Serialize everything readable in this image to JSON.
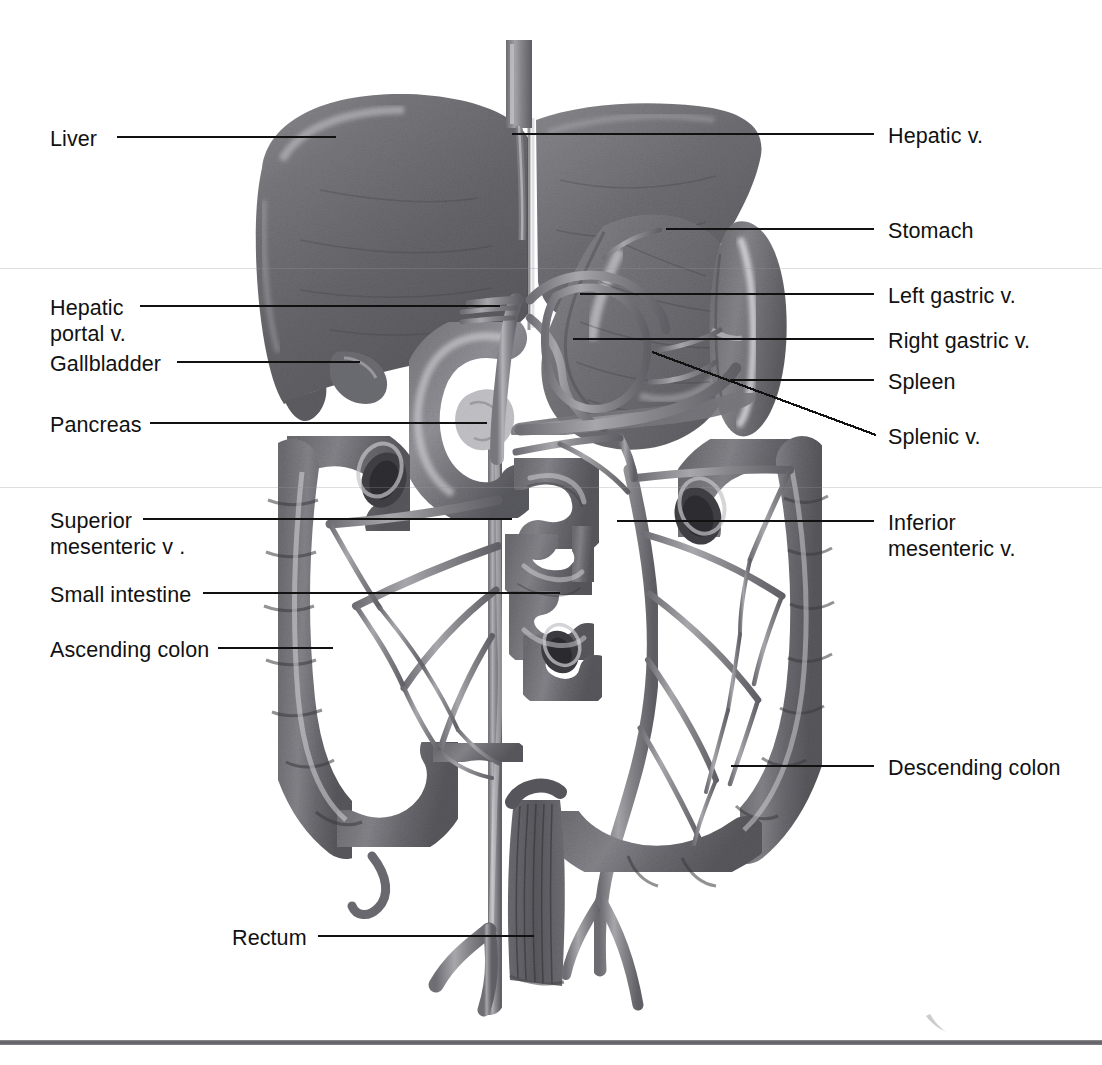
{
  "figure": {
    "style": "grayscale anatomical illustration",
    "background_color": "#ffffff",
    "line_color": "#111111",
    "rule_color": "#5d5d63"
  },
  "labels_left": [
    {
      "id": "liver",
      "text": "Liver",
      "x": 50,
      "y": 126,
      "lines": [
        "Liver"
      ],
      "leader": {
        "x1": 117,
        "y1": 137,
        "x2": 336,
        "y2": 137
      }
    },
    {
      "id": "hepatic-portal-v",
      "text": "Hepatic portal v.",
      "x": 50,
      "y": 295,
      "lines": [
        "Hepatic",
        "portal v."
      ],
      "leader": {
        "x1": 140,
        "y1": 306,
        "x2": 500,
        "y2": 306
      }
    },
    {
      "id": "gallbladder",
      "text": "Gallbladder",
      "x": 50,
      "y": 351,
      "lines": [
        "Gallbladder"
      ],
      "leader": {
        "x1": 177,
        "y1": 362,
        "x2": 360,
        "y2": 362
      }
    },
    {
      "id": "pancreas",
      "text": "Pancreas",
      "x": 50,
      "y": 412,
      "lines": [
        "Pancreas"
      ],
      "leader": {
        "x1": 150,
        "y1": 423,
        "x2": 487,
        "y2": 423
      }
    },
    {
      "id": "superior-mesenteric-v",
      "text": "Superior mesenteric v .",
      "x": 50,
      "y": 508,
      "lines": [
        "Superior",
        "mesenteric v ."
      ],
      "leader": {
        "x1": 143,
        "y1": 519,
        "x2": 512,
        "y2": 519
      }
    },
    {
      "id": "small-intestine",
      "text": "Small intestine",
      "x": 50,
      "y": 582,
      "lines": [
        "Small intestine"
      ],
      "leader": {
        "x1": 203,
        "y1": 593,
        "x2": 560,
        "y2": 593
      }
    },
    {
      "id": "ascending-colon",
      "text": "Ascending colon",
      "x": 50,
      "y": 637,
      "lines": [
        "Ascending colon"
      ],
      "leader": {
        "x1": 218,
        "y1": 648,
        "x2": 333,
        "y2": 648
      }
    },
    {
      "id": "rectum",
      "text": "Rectum",
      "x": 232,
      "y": 925,
      "lines": [
        "Rectum"
      ],
      "leader": {
        "x1": 318,
        "y1": 936,
        "x2": 534,
        "y2": 936
      }
    }
  ],
  "labels_right": [
    {
      "id": "hepatic-v",
      "text": "Hepatic v.",
      "x": 888,
      "y": 123,
      "lines": [
        "Hepatic v."
      ],
      "leader": {
        "x1": 512,
        "y1": 134,
        "x2": 874,
        "y2": 134
      }
    },
    {
      "id": "stomach",
      "text": "Stomach",
      "x": 888,
      "y": 218,
      "lines": [
        "Stomach"
      ],
      "leader": {
        "x1": 666,
        "y1": 229,
        "x2": 874,
        "y2": 229
      }
    },
    {
      "id": "left-gastric-v",
      "text": "Left gastric v.",
      "x": 888,
      "y": 283,
      "lines": [
        "Left gastric v."
      ],
      "leader": {
        "x1": 580,
        "y1": 294,
        "x2": 874,
        "y2": 294
      }
    },
    {
      "id": "right-gastric-v",
      "text": "Right gastric v.",
      "x": 888,
      "y": 328,
      "lines": [
        "Right gastric v."
      ],
      "leader": {
        "x1": 573,
        "y1": 339,
        "x2": 874,
        "y2": 339
      }
    },
    {
      "id": "spleen",
      "text": "Spleen",
      "x": 888,
      "y": 369,
      "lines": [
        "Spleen"
      ],
      "leader": {
        "x1": 730,
        "y1": 380,
        "x2": 874,
        "y2": 380
      }
    },
    {
      "id": "splenic-v",
      "text": "Splenic v.",
      "x": 888,
      "y": 424,
      "lines": [
        "Splenic v."
      ],
      "leader": {
        "x1": 652,
        "y1": 352,
        "x2": 876,
        "y2": 435
      }
    },
    {
      "id": "inferior-mesenteric-v",
      "text": "Inferior mesenteric v.",
      "x": 888,
      "y": 510,
      "lines": [
        "Inferior",
        "mesenteric v."
      ],
      "leader": {
        "x1": 617,
        "y1": 521,
        "x2": 874,
        "y2": 521
      }
    },
    {
      "id": "descending-colon",
      "text": "Descending colon",
      "x": 888,
      "y": 755,
      "lines": [
        "Descending colon"
      ],
      "leader": {
        "x1": 731,
        "y1": 766,
        "x2": 874,
        "y2": 766
      }
    }
  ],
  "decor": {
    "scanlines_y": [
      268,
      487
    ],
    "bottom_rule_y": 1040
  }
}
